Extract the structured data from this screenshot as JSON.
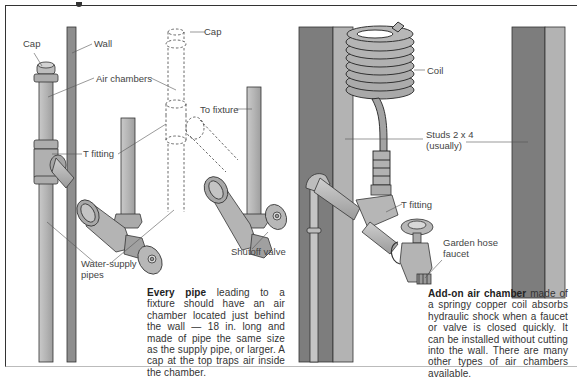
{
  "figure": {
    "left_panel": {
      "labels": {
        "cap_left": "Cap",
        "wall": "Wall",
        "air_chambers": "Air chambers",
        "cap_dashed": "Cap",
        "to_fixture": "To fixture",
        "t_fitting": "T fitting",
        "water_supply_line1": "Water-supply",
        "water_supply_line2": "pipes",
        "shutoff_valve": "Shutoff valve"
      },
      "caption": {
        "bold": "Every pipe",
        "text": " leading to a fixture should have an air chamber located just behind the wall — 18 in. long and made of pipe the same size as the supply pipe, or larger. A cap at the top traps air inside the chamber."
      }
    },
    "right_panel": {
      "labels": {
        "coil": "Coil",
        "studs_line1": "Studs 2 x 4",
        "studs_line2": "(usually)",
        "t_fitting": "T fitting",
        "garden_hose_line1": "Garden hose",
        "garden_hose_line2": "faucet"
      },
      "caption": {
        "bold": "Add-on air chamber",
        "text": " made of a springy copper coil absorbs hydraulic shock when a faucet or valve is closed quickly. It can be installed without cutting into the wall. There are many other types of air chambers available."
      }
    },
    "colors": {
      "pipe": "#b9b9b9",
      "pipe_outline": "#333333",
      "stud_dark": "#7d7d7d",
      "stud_light": "#b3b3b3",
      "wall": "#8a8a8a",
      "leader": "#555555"
    }
  }
}
